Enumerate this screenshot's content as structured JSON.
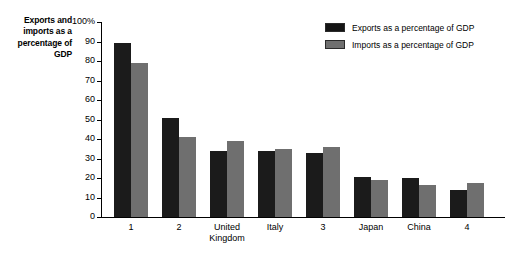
{
  "chart_data": {
    "type": "bar",
    "title": "",
    "xlabel": "",
    "ylabel": "Exports and imports as a percentage of GDP",
    "ylim": [
      0,
      100
    ],
    "yticks": [
      "0",
      "10",
      "20",
      "30",
      "40",
      "50",
      "60",
      "70",
      "80",
      "90",
      "100%"
    ],
    "grid": false,
    "legend_position": "top-right",
    "categories": [
      "1",
      "2",
      "United Kingdom",
      "Italy",
      "3",
      "Japan",
      "China",
      "4"
    ],
    "series": [
      {
        "name": "Exports as a percentage of GDP",
        "color": "#1b1b1b",
        "values": [
          89,
          51,
          34,
          34,
          33,
          20.5,
          20,
          14
        ]
      },
      {
        "name": "Imports as a percentage of GDP",
        "color": "#6f6f6f",
        "values": [
          79,
          41,
          39,
          35,
          36,
          19,
          16.5,
          17.5
        ]
      }
    ]
  },
  "legend": {
    "items": [
      {
        "label": "Exports as a percentage of GDP",
        "swatch": "exports"
      },
      {
        "label": "Imports as a percentage of GDP",
        "swatch": "imports"
      }
    ]
  }
}
